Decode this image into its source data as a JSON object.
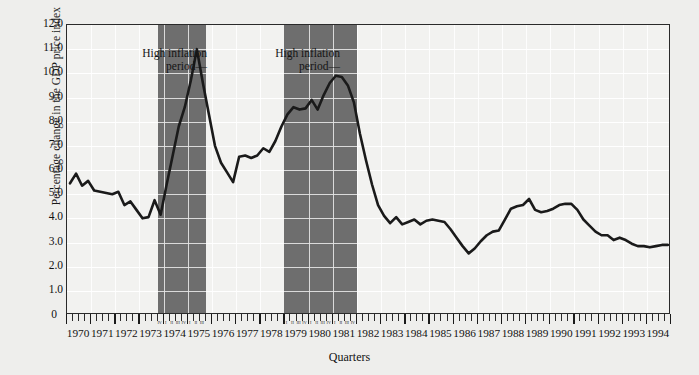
{
  "chart_data": {
    "type": "line",
    "title": "",
    "xlabel": "Quarters",
    "ylabel": "Percentage change in the GDP price index",
    "ylim": [
      0,
      12.0
    ],
    "ytick_labels": [
      "12.0",
      "11.0",
      "10.0",
      "9.0",
      "8.0",
      "7.0",
      "6.0",
      "5.0",
      "4.0",
      "3.0",
      "2.0",
      "1.0",
      "0"
    ],
    "ytick_values": [
      12.0,
      11.0,
      10.0,
      9.0,
      8.0,
      7.0,
      6.0,
      5.0,
      4.0,
      3.0,
      2.0,
      1.0,
      0
    ],
    "grid": true,
    "legend": "none",
    "x_start_year": 1970,
    "x_end_year": 1994,
    "quarters_per_year": 4,
    "xtick_year_labels": [
      "1970",
      "1971",
      "1972",
      "1973",
      "1974",
      "1975",
      "1976",
      "1977",
      "1978",
      "1979",
      "1980",
      "1981",
      "1982",
      "1983",
      "1984",
      "1985",
      "1986",
      "1987",
      "1988",
      "1989",
      "1990",
      "1991",
      "1992",
      "1993",
      "1994"
    ],
    "quarter_marks": [
      "I",
      "II",
      "III",
      "IV"
    ],
    "annotations": [
      {
        "line1": "High inflation",
        "line2": "period—",
        "target": "band-1"
      },
      {
        "line1": "High inflation",
        "line2": "period—",
        "target": "band-2"
      }
    ],
    "shaded_bands": [
      {
        "name": "band-1",
        "label": "High inflation period",
        "start_quarter_index": 15,
        "end_quarter_index": 22,
        "start": "1973 Q4",
        "end": "1975 Q3",
        "color": "#6e6e6e"
      },
      {
        "name": "band-2",
        "label": "High inflation period",
        "start_quarter_index": 36,
        "end_quarter_index": 47,
        "start": "1979 Q1",
        "end": "1981 Q4",
        "color": "#6e6e6e"
      }
    ],
    "series": [
      {
        "name": "Percentage change in the GDP price index",
        "color": "#1a1a1a",
        "values": [
          5.45,
          5.85,
          5.35,
          5.55,
          5.15,
          5.1,
          5.05,
          5.0,
          5.1,
          4.55,
          4.7,
          4.35,
          4.0,
          4.05,
          4.75,
          4.15,
          5.4,
          6.6,
          7.8,
          8.6,
          9.7,
          11.0,
          9.6,
          8.3,
          7.0,
          6.3,
          5.9,
          5.5,
          6.55,
          6.6,
          6.5,
          6.6,
          6.9,
          6.75,
          7.2,
          7.8,
          8.3,
          8.6,
          8.5,
          8.55,
          8.9,
          8.5,
          9.1,
          9.6,
          9.9,
          9.85,
          9.5,
          8.8,
          7.5,
          6.4,
          5.4,
          4.55,
          4.1,
          3.8,
          4.05,
          3.75,
          3.85,
          3.95,
          3.75,
          3.9,
          3.95,
          3.9,
          3.85,
          3.55,
          3.2,
          2.85,
          2.55,
          2.75,
          3.05,
          3.3,
          3.45,
          3.5,
          3.95,
          4.4,
          4.5,
          4.55,
          4.8,
          4.35,
          4.25,
          4.3,
          4.4,
          4.55,
          4.6,
          4.6,
          4.35,
          3.95,
          3.7,
          3.45,
          3.3,
          3.3,
          3.1,
          3.2,
          3.1,
          2.95,
          2.85,
          2.85,
          2.8,
          2.85,
          2.9,
          2.9
        ]
      }
    ]
  },
  "axis": {
    "y_title": "Percentage change in the GDP price index",
    "x_title": "Quarters"
  }
}
